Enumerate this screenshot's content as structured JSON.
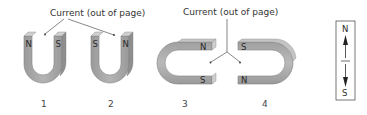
{
  "figure": {
    "callouts": [
      {
        "text": "Current (out of page)"
      },
      {
        "text": "Current (out of page)"
      }
    ],
    "magnets": [
      {
        "number": "1",
        "orientation": "U-up",
        "left_pole": "N",
        "right_pole": "S"
      },
      {
        "number": "2",
        "orientation": "U-up",
        "left_pole": "S",
        "right_pole": "N"
      },
      {
        "number": "3",
        "orientation": "U-opening-right",
        "top_pole": "N",
        "bottom_pole": "S"
      },
      {
        "number": "4",
        "orientation": "U-opening-left",
        "top_pole": "S",
        "bottom_pole": "N"
      }
    ],
    "compass": {
      "top_label": "N",
      "bottom_label": "S"
    },
    "colors": {
      "magnet_face": "#a8a8a8",
      "magnet_side": "#8e8e8e",
      "magnet_top": "#c9c9c9",
      "line": "#555555"
    }
  }
}
